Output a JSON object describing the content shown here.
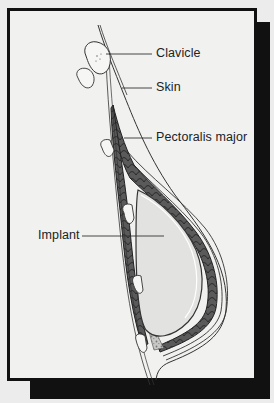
{
  "figure": {
    "labels": {
      "clavicle": "Clavicle",
      "skin": "Skin",
      "pectoralis": "Pectoralis major",
      "implant": "Implant"
    },
    "colors": {
      "background": "#ececec",
      "panel": "#f1f1f0",
      "frame": "#111111",
      "muscle": "#4a4a4a",
      "implant_fill": "#e2e2e0",
      "fat_stipple": "#9a9a9a",
      "line": "#333333"
    }
  }
}
